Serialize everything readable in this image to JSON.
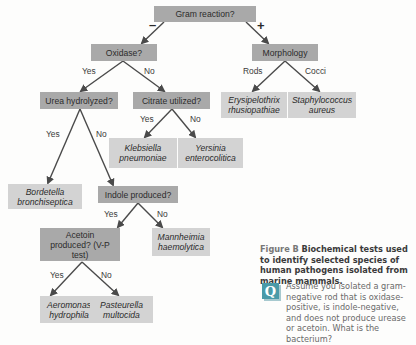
{
  "nodes": {
    "gram": "Gram reaction?",
    "oxidase": "Oxidase?",
    "morphology": "Morphology",
    "urea": "Urea hydrolyzed?",
    "citrate": "Citrate utilized?",
    "erysipelothrix": "Erysipelothrix rhusiopathiae",
    "staphylococcus": "Staphylococcus aureus",
    "klebsiella": "Klebsiella pneumoniae",
    "yersinia": "Yersinia enterocolitica",
    "bordetella": "Bordetella bronchiseptica",
    "indole": "Indole produced?",
    "acetoin": "Acetoin produced? (V-P test)",
    "mannheimia": "Mannheimia haemolytica",
    "aeromonas": "Aeromonas hydrophila",
    "pasteurella": "Pasteurella multocida"
  },
  "edges": {
    "gram_neg": "–",
    "gram_pos": "+",
    "oxidase_yes": "Yes",
    "oxidase_no": "No",
    "morph_rods": "Rods",
    "morph_cocci": "Cocci",
    "citrate_yes": "Yes",
    "citrate_no": "No",
    "urea_yes": "Yes",
    "urea_no": "No",
    "indole_yes": "Yes",
    "indole_no": "No",
    "acetoin_yes": "Yes",
    "acetoin_no": "No"
  },
  "caption": {
    "figure_label": "Figure B",
    "title": "Biochemical tests used to identify selected species of human pathogens isolated from marine mammals."
  },
  "question": {
    "icon": "Q",
    "text": "Assume you isolated a gram-negative rod that is oxidase-positive, is indole-negative, and does not produce urease or acetoin. What is the bacterium?"
  },
  "colors": {
    "question_box": "#a9a9a9",
    "answer_box": "#d3d3d3",
    "arrow": "#4a4a4a",
    "q_icon": "#4a9aa8"
  }
}
